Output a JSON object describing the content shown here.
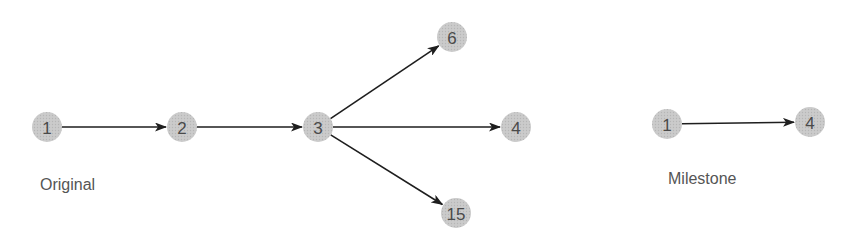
{
  "colors": {
    "node_fill": "#c9c9c9",
    "node_dot": "#b4b4b4",
    "node_text": "#4a4a4a",
    "edge": "#1e1e1e",
    "caption": "#555555",
    "background": "#ffffff"
  },
  "diagrams": [
    {
      "id": "original",
      "caption": "Original",
      "caption_pos": {
        "x": 40,
        "y": 190
      },
      "nodes": [
        {
          "id": "n1",
          "label": "1",
          "x": 47,
          "y": 127
        },
        {
          "id": "n2",
          "label": "2",
          "x": 182,
          "y": 127
        },
        {
          "id": "n3",
          "label": "3",
          "x": 318,
          "y": 127
        },
        {
          "id": "n6",
          "label": "6",
          "x": 452,
          "y": 37
        },
        {
          "id": "n4",
          "label": "4",
          "x": 516,
          "y": 127
        },
        {
          "id": "n15",
          "label": "15",
          "x": 456,
          "y": 213
        }
      ],
      "edges": [
        {
          "from": "n1",
          "to": "n2"
        },
        {
          "from": "n2",
          "to": "n3"
        },
        {
          "from": "n3",
          "to": "n6"
        },
        {
          "from": "n3",
          "to": "n4"
        },
        {
          "from": "n3",
          "to": "n15"
        }
      ]
    },
    {
      "id": "milestone",
      "caption": "Milestone",
      "caption_pos": {
        "x": 668,
        "y": 184
      },
      "nodes": [
        {
          "id": "m1",
          "label": "1",
          "x": 667,
          "y": 124
        },
        {
          "id": "m4",
          "label": "4",
          "x": 810,
          "y": 122
        }
      ],
      "edges": [
        {
          "from": "m1",
          "to": "m4"
        }
      ]
    }
  ],
  "node_radius": 15
}
